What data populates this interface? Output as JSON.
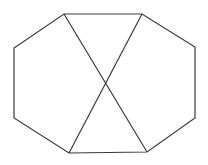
{
  "diagram": {
    "type": "octagon-with-crossing-diagonals",
    "background": "#ffffff",
    "stroke_color": "#3a3a3a",
    "stroke_width": 1.2,
    "vertices": {
      "top_left": [
        64,
        14
      ],
      "top_right": [
        142,
        14
      ],
      "right_upper": [
        195,
        47
      ],
      "right_lower": [
        195,
        118
      ],
      "bottom_right": [
        147,
        152
      ],
      "bottom_left": [
        69,
        153
      ],
      "left_lower": [
        14,
        118
      ],
      "left_upper": [
        14,
        48
      ]
    },
    "octagon_points": "64,14 142,14 195,47 195,118 147,152 69,153 14,118 14,48",
    "diagonal_1": {
      "x1": 64,
      "y1": 14,
      "x2": 147,
      "y2": 152
    },
    "diagonal_2": {
      "x1": 142,
      "y1": 14,
      "x2": 69,
      "y2": 153
    },
    "intersection": [
      106,
      84
    ]
  }
}
